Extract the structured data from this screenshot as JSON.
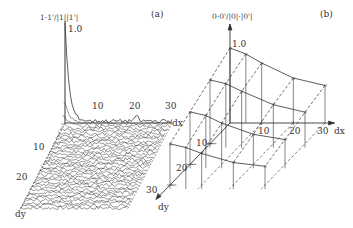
{
  "chart_data": [
    {
      "panel": "(a)",
      "type": "line",
      "style": "3d-waterfall",
      "title": "",
      "zlabel": "1·1'/|1||1'|",
      "xlabel": "dx",
      "ylabel": "dy",
      "x_ticks": [
        10,
        20,
        30
      ],
      "y_ticks": [
        10,
        20
      ],
      "z_ticks": [
        1.0
      ],
      "xlim": [
        0,
        30
      ],
      "ylim": [
        0,
        30
      ],
      "zlim": [
        0,
        1.0
      ],
      "description": "Autocorrelation waterfall: sharp peak of 1.0 at dx=0, dy=0 decaying rapidly to near 0 with small fluctuations; stacked noisy traces for dy = 0..30",
      "series": [
        {
          "name": "dy=0",
          "x": [
            0,
            1,
            2,
            3,
            5,
            8,
            10,
            15,
            20,
            25,
            30
          ],
          "values": [
            1.0,
            0.45,
            0.25,
            0.15,
            0.08,
            0.04,
            0.03,
            0.03,
            0.05,
            0.02,
            0.02
          ]
        },
        {
          "name": "dy=1",
          "x": [
            0,
            1,
            2,
            3,
            5,
            8,
            10,
            15,
            20,
            25,
            30
          ],
          "values": [
            0.4,
            0.25,
            0.15,
            0.1,
            0.06,
            0.04,
            0.03,
            0.03,
            0.03,
            0.02,
            0.02
          ]
        }
      ]
    },
    {
      "panel": "(b)",
      "type": "line",
      "style": "3d-surface-wireframe",
      "title": "",
      "zlabel": "0·0'/|0|·|0'|",
      "xlabel": "dx",
      "ylabel": "dy",
      "x_ticks": [
        10,
        20,
        30
      ],
      "y_ticks": [
        10,
        20,
        30
      ],
      "z_ticks": [
        1.0
      ],
      "xlim": [
        0,
        30
      ],
      "ylim": [
        0,
        30
      ],
      "zlim": [
        0,
        1.0
      ],
      "grid_points_dx": [
        0,
        5,
        10,
        20,
        30
      ],
      "grid_points_dy": [
        0,
        10,
        20,
        30
      ],
      "description": "Smooth correlation surface: 1.0 at origin decreasing slowly with dx and dy; sampled on a grid with vertical drop lines",
      "series": [
        {
          "name": "dy=0",
          "x": [
            0,
            5,
            10,
            20,
            30
          ],
          "values": [
            1.0,
            0.92,
            0.8,
            0.6,
            0.5
          ]
        },
        {
          "name": "dy=10",
          "x": [
            0,
            5,
            10,
            20,
            30
          ],
          "values": [
            0.85,
            0.8,
            0.7,
            0.52,
            0.42
          ]
        },
        {
          "name": "dy=20",
          "x": [
            0,
            5,
            10,
            20,
            30
          ],
          "values": [
            0.7,
            0.65,
            0.55,
            0.4,
            0.33
          ]
        },
        {
          "name": "dy=30",
          "x": [
            0,
            5,
            10,
            20,
            30
          ],
          "values": [
            0.55,
            0.5,
            0.42,
            0.3,
            0.25
          ]
        }
      ]
    }
  ],
  "panel_a": {
    "label": "(a)",
    "z_axis_title": "1·1'/|1||1'|",
    "z_tick": "1.0",
    "x_ticks": [
      "10",
      "20",
      "30"
    ],
    "x_axis_label": "dx",
    "y_ticks": [
      "10",
      "20"
    ],
    "y_axis_label": "dy"
  },
  "panel_b": {
    "label": "(b)",
    "z_axis_title": "0·0'/|0|·|0'|",
    "z_tick": "1.0",
    "x_ticks": [
      "10",
      "20",
      "30"
    ],
    "x_axis_label": "dx",
    "y_ticks": [
      "10",
      "20",
      "30"
    ],
    "y_axis_label": "dy"
  }
}
